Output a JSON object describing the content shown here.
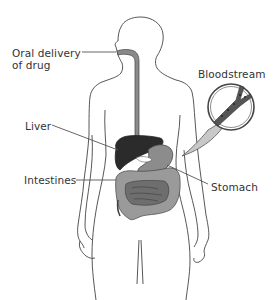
{
  "diagram": {
    "labels": {
      "oral_delivery": "Oral delivery\nof drug",
      "bloodstream": "Bloodstream",
      "liver": "Liver",
      "intestines": "Intestines",
      "stomach": "Stomach"
    },
    "colors": {
      "outline": "#444444",
      "esophagus": "#8a8a8a",
      "liver": "#2b2b2b",
      "stomach": "#8c8c8c",
      "intestines": "#9a9a9a",
      "intestines_inner": "#6e6e6e",
      "magnifier_fill": "#c8c8c8",
      "vessel": "#555555",
      "leader_line": "#555555",
      "text": "#333333"
    }
  }
}
